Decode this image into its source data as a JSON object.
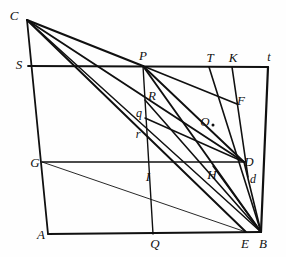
{
  "figure": {
    "kind": "geometric-diagram",
    "background_color": "#fefefe",
    "ink_color": "#101010",
    "width": 286,
    "height": 257,
    "labels": [
      {
        "name": "point-label-C",
        "text": "C",
        "x": 14,
        "y": 15,
        "size": "big"
      },
      {
        "name": "point-label-S",
        "text": "S",
        "x": 19,
        "y": 64,
        "size": "big"
      },
      {
        "name": "point-label-P",
        "text": "P",
        "x": 143,
        "y": 55,
        "size": "big"
      },
      {
        "name": "point-label-T",
        "text": "T",
        "x": 210,
        "y": 57,
        "size": "big"
      },
      {
        "name": "point-label-K",
        "text": "K",
        "x": 233,
        "y": 57,
        "size": "big"
      },
      {
        "name": "point-label-t",
        "text": "t",
        "x": 269,
        "y": 57,
        "size": "small"
      },
      {
        "name": "point-label-R",
        "text": "R",
        "x": 152,
        "y": 95,
        "size": "big"
      },
      {
        "name": "point-label-F",
        "text": "F",
        "x": 241,
        "y": 100,
        "size": "big"
      },
      {
        "name": "point-label-q",
        "text": "q",
        "x": 139,
        "y": 113,
        "size": "small"
      },
      {
        "name": "point-label-O",
        "text": "O",
        "x": 205,
        "y": 121,
        "size": "big"
      },
      {
        "name": "point-label-r",
        "text": "r",
        "x": 138,
        "y": 134,
        "size": "small"
      },
      {
        "name": "point-label-G",
        "text": "G",
        "x": 35,
        "y": 162,
        "size": "big"
      },
      {
        "name": "point-label-D",
        "text": "D",
        "x": 249,
        "y": 161,
        "size": "big"
      },
      {
        "name": "point-label-I",
        "text": "I",
        "x": 148,
        "y": 176,
        "size": "big"
      },
      {
        "name": "point-label-H",
        "text": "H",
        "x": 212,
        "y": 174,
        "size": "big"
      },
      {
        "name": "point-label-d",
        "text": "d",
        "x": 253,
        "y": 179,
        "size": "small"
      },
      {
        "name": "point-label-A",
        "text": "A",
        "x": 41,
        "y": 234,
        "size": "big"
      },
      {
        "name": "point-label-Q",
        "text": "Q",
        "x": 155,
        "y": 243,
        "size": "big"
      },
      {
        "name": "point-label-E",
        "text": "E",
        "x": 245,
        "y": 243,
        "size": "big"
      },
      {
        "name": "point-label-B",
        "text": "B",
        "x": 263,
        "y": 243,
        "size": "big"
      }
    ],
    "marks": [
      {
        "name": "point-dot-O",
        "x": 213,
        "y": 125
      }
    ],
    "vertices": {
      "C": [
        27,
        20
      ],
      "S": [
        28,
        66
      ],
      "P": [
        143,
        66
      ],
      "T": [
        209,
        67
      ],
      "K": [
        232,
        67
      ],
      "t": [
        268,
        67
      ],
      "R": [
        145,
        100
      ],
      "F": [
        237,
        104
      ],
      "q": [
        145,
        118
      ],
      "r": [
        145,
        137
      ],
      "G": [
        42,
        162
      ],
      "I": [
        145,
        162
      ],
      "H": [
        213,
        166
      ],
      "D": [
        244,
        162
      ],
      "d": [
        248,
        177
      ],
      "A": [
        48,
        234
      ],
      "Q": [
        153,
        234
      ],
      "E": [
        246,
        232
      ],
      "B": [
        261,
        232
      ]
    },
    "segments": [
      {
        "name": "segment-C-A",
        "from": "C",
        "to": "A",
        "w": 1.8
      },
      {
        "name": "segment-A-B",
        "from": "A",
        "to": "B",
        "w": 1.8
      },
      {
        "name": "segment-t-B",
        "from": "t",
        "to": "B",
        "w": 2.2
      },
      {
        "name": "segment-S-t",
        "from": "S",
        "to": "t",
        "w": 1.8
      },
      {
        "name": "segment-G-D",
        "from": "G",
        "to": "D",
        "w": 1.6
      },
      {
        "name": "segment-C-P",
        "from": "C",
        "to": "P",
        "w": 2.0
      },
      {
        "name": "segment-C-D",
        "from": "C",
        "to": "D",
        "w": 1.9
      },
      {
        "name": "segment-C-E",
        "from": "C",
        "to": "E",
        "w": 1.9
      },
      {
        "name": "segment-C-B",
        "from": "C",
        "to": "B",
        "w": 1.5
      },
      {
        "name": "segment-P-Q",
        "from": "P",
        "to": "Q",
        "w": 1.4
      },
      {
        "name": "segment-P-F",
        "from": "P",
        "to": "F",
        "w": 1.7
      },
      {
        "name": "segment-P-D",
        "from": "P",
        "to": "D",
        "w": 1.9
      },
      {
        "name": "segment-P-B",
        "from": "P",
        "to": "B",
        "w": 1.9
      },
      {
        "name": "segment-T-B",
        "from": "T",
        "to": "B",
        "w": 1.6
      },
      {
        "name": "segment-K-d",
        "from": "K",
        "to": "d",
        "w": 1.6
      },
      {
        "name": "segment-R-B",
        "from": "R",
        "to": "B",
        "w": 1.6
      },
      {
        "name": "segment-q-D",
        "from": "q",
        "to": "D",
        "w": 1.5
      },
      {
        "name": "segment-D-B",
        "from": "D",
        "to": "B",
        "w": 1.6
      },
      {
        "name": "segment-H-B",
        "from": "H",
        "to": "B",
        "w": 1.4
      },
      {
        "name": "segment-G-E",
        "from": "G",
        "to": "E",
        "w": 0.9
      }
    ]
  }
}
